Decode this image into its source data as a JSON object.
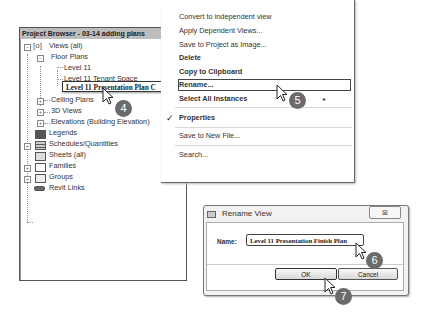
{
  "project_browser": {
    "title": "Project Browser - 03-14 adding plans",
    "tree": {
      "views_all": "Views (all)",
      "floor_plans": "Floor Plans",
      "level_11": "Level 11",
      "level_11_tenant": "Level 11 Tenant Space",
      "level_11_presentation_editing": "Level 11 Presentation Plan C",
      "ceiling_plans": "Ceiling Plans",
      "views_3d": "3D Views",
      "elevations": "Elevations (Building Elevation)",
      "legends": "Legends",
      "schedules": "Schedules/Quantities",
      "sheets": "Sheets (all)",
      "families": "Families",
      "groups": "Groups",
      "revit_links": "Revit Links"
    }
  },
  "context_menu": {
    "items": [
      {
        "label": "Convert to independent view"
      },
      {
        "label": "Apply Dependent Views..."
      },
      {
        "label": "Save to Project as Image..."
      },
      {
        "label": "Delete"
      },
      {
        "label": "Copy to Clipboard"
      },
      {
        "label": "Rename..."
      },
      {
        "label": "Select All Instances"
      },
      {
        "label": "Properties"
      },
      {
        "label": "Save to New File..."
      },
      {
        "label": "Search..."
      }
    ],
    "submenu_arrow": "▸",
    "check": "✓"
  },
  "dialog": {
    "title": "Rename View",
    "close_glyph": "⊠",
    "name_label": "Name:",
    "name_value": "Level 11 Presentation Finish Plan",
    "ok_label": "OK",
    "cancel_label": "Cancel"
  },
  "step_badges": [
    "4",
    "5",
    "6",
    "7"
  ],
  "tree_expanders": {
    "minus": "−",
    "plus": "+"
  }
}
